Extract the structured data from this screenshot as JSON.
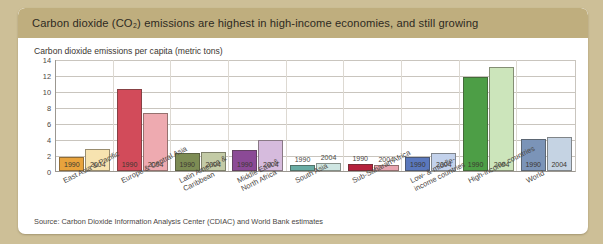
{
  "header": {
    "title": "Carbon dioxide (CO₂) emissions are highest in high-income economies, and still growing",
    "band_color": "#bfae7e"
  },
  "subtitle": "Carbon dioxide emissions per capita (metric tons)",
  "source": "Source: Carbon Dioxide Information Analysis Center (CDIAC) and World Bank estimates",
  "page_background": "#cdbf97",
  "chart_data": {
    "type": "bar",
    "title": "Carbon dioxide emissions per capita (metric tons)",
    "xlabel": "",
    "ylabel": "",
    "ylim": [
      0,
      14
    ],
    "yticks": [
      0,
      2,
      4,
      6,
      8,
      10,
      12,
      14
    ],
    "grid": true,
    "legend": "none",
    "categories": [
      "East Asia & Pacific",
      "Europe & Central Asia",
      "Latin America &\nCaribbean",
      "Middle East &\nNorth Africa",
      "South Asia",
      "Sub-Saharan Africa",
      "Low- & middle-\nincome countries",
      "High-income countries",
      "World"
    ],
    "series": [
      {
        "name": "1990",
        "values": [
          1.7,
          10.3,
          2.3,
          2.6,
          0.7,
          0.9,
          1.8,
          11.8,
          4.0
        ]
      },
      {
        "name": "2004",
        "values": [
          2.8,
          7.3,
          2.4,
          3.9,
          1.0,
          0.8,
          2.2,
          13.0,
          4.3
        ]
      }
    ],
    "group_colors": [
      {
        "c1990": "#e8a33d",
        "c2004": "#f7e3b0"
      },
      {
        "c1990": "#d24b5a",
        "c2004": "#eeaab0"
      },
      {
        "c1990": "#7d8c54",
        "c2004": "#c3cba6"
      },
      {
        "c1990": "#8b4a96",
        "c2004": "#d6bbdd"
      },
      {
        "c1990": "#69aca4",
        "c2004": "#cfe6e2"
      },
      {
        "c1990": "#b5213c",
        "c2004": "#e9a6b1"
      },
      {
        "c1990": "#5a78bd",
        "c2004": "#c3d2ec"
      },
      {
        "c1990": "#4d9e46",
        "c2004": "#cce5bb"
      },
      {
        "c1990": "#7b94b8",
        "c2004": "#c5d3e3"
      }
    ],
    "bar_labels_inside": [
      true,
      true,
      true,
      true,
      false,
      false,
      true,
      true,
      true
    ]
  }
}
